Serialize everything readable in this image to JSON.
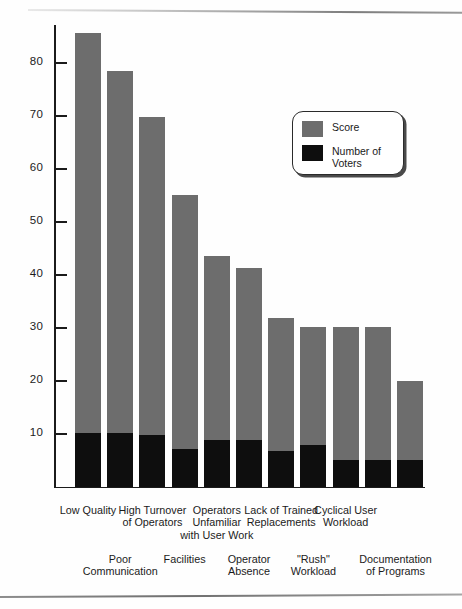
{
  "chart_data": {
    "type": "bar",
    "subtype": "stacked",
    "title": "",
    "xlabel": "",
    "ylabel": "",
    "ylim": [
      0,
      90
    ],
    "grid": false,
    "legend_position": "upper-right",
    "y_ticks": [
      10,
      20,
      30,
      40,
      50,
      60,
      70,
      80
    ],
    "series": [
      {
        "name": "Score",
        "color": "#6d6d6d",
        "values": [
          85.5,
          78.3,
          69.7,
          55.0,
          43.4,
          41.2,
          31.8,
          30.0,
          30.0,
          30.0,
          19.8
        ]
      },
      {
        "name": "Number of Voters",
        "color": "#0e0e0e",
        "values": [
          10.0,
          10.0,
          9.8,
          7.0,
          8.8,
          8.8,
          6.7,
          7.8,
          5.0,
          5.0,
          5.0
        ]
      }
    ],
    "categories": [
      "Low Quality",
      "Poor Communication",
      "High Turnover of Operators",
      "Facilities",
      "Operators Unfamiliar with User Work",
      "Operator Absence",
      "Lack of Trained Replacements",
      "\"Rush\" Workload",
      "Cyclical User Workload",
      "Documentation of Programs",
      "Documentation of Programs"
    ],
    "note": "Score values are total bar heights; Number of Voters is the black lower segment of each stacked bar."
  },
  "legend": {
    "entries": [
      {
        "label": "Score",
        "color": "#6d6d6d",
        "swatch_name": "score-swatch"
      },
      {
        "label": "Number of\nVoters",
        "color": "#0e0e0e",
        "swatch_name": "voters-swatch"
      }
    ]
  },
  "axis": {
    "y_ticks": [
      {
        "value": 80,
        "label": "80"
      },
      {
        "value": 70,
        "label": "70"
      },
      {
        "value": 60,
        "label": "60"
      },
      {
        "value": 50,
        "label": "50"
      },
      {
        "value": 40,
        "label": "40"
      },
      {
        "value": 30,
        "label": "30"
      },
      {
        "value": 20,
        "label": "20"
      },
      {
        "value": 10,
        "label": "10"
      }
    ]
  },
  "category_labels": {
    "top_row": [
      "Low Quality",
      "High Turnover\nof Operators",
      "Operators\nUnfamiliar\nwith User Work",
      "Lack of Trained\nReplacements",
      "Cyclical User\nWorkload"
    ],
    "bottom_row": [
      "Poor\nCommunication",
      "Facilities",
      "Operator\nAbsence",
      "\"Rush\"\nWorkload",
      "Documentation\nof Programs"
    ]
  }
}
